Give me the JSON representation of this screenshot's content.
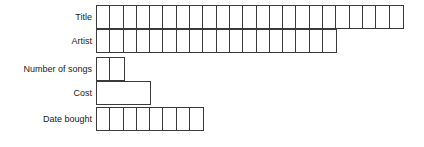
{
  "diagram": {
    "type": "database-field-length-diagram",
    "cell_width_px": 13.3,
    "row_height_px": 24,
    "grid_left_px": 100,
    "border_color": "#3a3a3a",
    "background_color": "#ffffff",
    "text_color": "#1a1a1a",
    "rows": [
      {
        "label": "Title",
        "cells": 23,
        "wide_cells": 0,
        "width_px": 312
      },
      {
        "label": "Artist",
        "cells": 18,
        "wide_cells": 0,
        "width_px": 248
      },
      {
        "label": "Number of songs",
        "cells": 2,
        "wide_cells": 0,
        "width_px": 27
      },
      {
        "label": "Cost",
        "cells": 0,
        "wide_cells": 1,
        "width_px": 53
      },
      {
        "label": "Date bought",
        "cells": 8,
        "wide_cells": 0,
        "width_px": 106
      }
    ]
  }
}
